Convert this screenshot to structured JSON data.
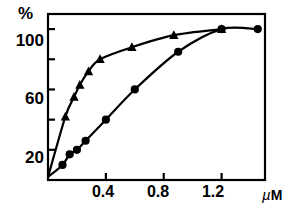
{
  "chart_data": {
    "type": "line",
    "title": "",
    "xlabel": "µM",
    "ylabel": "%",
    "xlim": [
      0,
      1.5
    ],
    "ylim": [
      0,
      110
    ],
    "grid": false,
    "legend": "none",
    "xticks": [
      0.4,
      0.8,
      1.2
    ],
    "xtick_labels": [
      "0.4",
      "0.8",
      "1.2"
    ],
    "yticks": [
      20,
      40,
      60,
      80,
      100
    ],
    "ytick_labels": [
      "20",
      "",
      "60",
      "",
      "100"
    ],
    "series": [
      {
        "name": "triangle-series",
        "marker": "triangle",
        "x": [
          0.0,
          0.12,
          0.18,
          0.22,
          0.28,
          0.36,
          0.58,
          0.87,
          1.2
        ],
        "y": [
          2,
          42,
          55,
          63,
          72,
          80,
          88,
          96,
          100
        ]
      },
      {
        "name": "circle-series",
        "marker": "circle",
        "x": [
          0.0,
          0.1,
          0.15,
          0.2,
          0.26,
          0.4,
          0.6,
          0.9,
          1.2,
          1.45
        ],
        "y": [
          2,
          10,
          17,
          20,
          26,
          40,
          60,
          85,
          100,
          100
        ]
      }
    ]
  },
  "axis": {
    "y_unit_label": "%",
    "x_unit_mu": "µ",
    "x_unit_m": "M",
    "ytick_100": "100",
    "ytick_60": "60",
    "ytick_20": "20",
    "xtick_04": "0.4",
    "xtick_08": "0.8",
    "xtick_12": "1.2"
  },
  "colors": {
    "ink": "#000000",
    "background": "#ffffff"
  }
}
